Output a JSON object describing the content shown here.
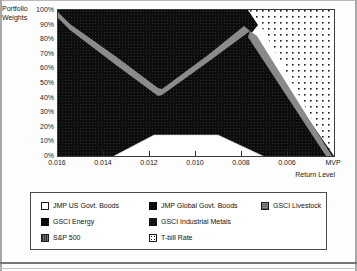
{
  "chart_data": {
    "type": "area",
    "title": "",
    "subtitle": "",
    "ylabel": "Portfolio Weights",
    "xlabel": "Return Level",
    "x_tick_labels": [
      "0.016",
      "0.014",
      "0.012",
      "0.010",
      "0.008",
      "0.006",
      "MVP"
    ],
    "y_tick_labels": [
      "100%",
      "90%",
      "80%",
      "70%",
      "60%",
      "50%",
      "40%",
      "30%",
      "20%",
      "10%",
      "0%"
    ],
    "ylim": [
      0,
      100
    ],
    "xlim_note": "Return level decreases left to right from 0.016 to MVP (minimum variance portfolio)",
    "grid": false,
    "stacked": true,
    "legend_position": "bottom",
    "legend_entries": [
      "JMP US Govt. Boods",
      "JMP Global Govt. Boods",
      "GSCI Livestock",
      "GSCI Energy",
      "GSCI Industrial Metals",
      "S&P 500",
      "T-bill Rate"
    ],
    "categories": [
      "0.016",
      "0.015",
      "0.014",
      "0.013",
      "0.012",
      "0.011",
      "0.010",
      "0.009",
      "0.008",
      "0.007",
      "0.006",
      "MVP"
    ],
    "series": [
      {
        "name": "JMP US Govt. Boods",
        "fill": "#ffffff",
        "pattern": "solid-white",
        "values": [
          0,
          0,
          0,
          7,
          14,
          14,
          14,
          8,
          0,
          0,
          0,
          0
        ]
      },
      {
        "name": "JMP Global Govt. Boods",
        "fill": "#0b0b0b",
        "pattern": "solid-black",
        "values": [
          0,
          0,
          0,
          0,
          0,
          0,
          0,
          0,
          0,
          0,
          0,
          0
        ]
      },
      {
        "name": "GSCI Livestock",
        "fill": "#8d8d8d",
        "pattern": "gray",
        "values": [
          0,
          0,
          0,
          0,
          2,
          2,
          2,
          2,
          2,
          2,
          2,
          0
        ]
      },
      {
        "name": "GSCI Energy",
        "fill": "#141414",
        "pattern": "solid-black",
        "values": [
          100,
          92,
          84,
          72,
          55,
          64,
          73,
          80,
          84,
          60,
          36,
          5
        ]
      },
      {
        "name": "GSCI Industrial Metals",
        "fill": "#1a1a1a",
        "pattern": "solid-black",
        "values": [
          0,
          8,
          16,
          21,
          29,
          20,
          11,
          10,
          14,
          10,
          6,
          0
        ]
      },
      {
        "name": "S&P 500",
        "fill": "#6e6e6e",
        "pattern": "hatch",
        "values": [
          0,
          0,
          0,
          0,
          0,
          0,
          0,
          0,
          0,
          0,
          0,
          0
        ]
      },
      {
        "name": "T-bill Rate",
        "fill": "#ffffff",
        "pattern": "dotted",
        "values": [
          0,
          0,
          0,
          0,
          0,
          0,
          0,
          0,
          0,
          28,
          56,
          95
        ]
      }
    ],
    "boundary_notes": {
      "top_black_region_start_pct": 100,
      "valley_at_0.012_pct": 55,
      "peak_at_0.008_pct": 85,
      "white_plateau_pct": 14,
      "tbill_onset_x": "0.0082"
    }
  },
  "legend": {
    "rows": [
      [
        {
          "label": "JMP US Govt. Boods",
          "swatch": "sw-white",
          "icon": "legend-swatch-white"
        },
        {
          "label": "JMP Global Govt. Boods",
          "swatch": "sw-black",
          "icon": "legend-swatch-black"
        },
        {
          "label": "GSCI Livestock",
          "swatch": "sw-gray",
          "icon": "legend-swatch-gray"
        }
      ],
      [
        {
          "label": "GSCI Energy",
          "swatch": "sw-black",
          "icon": "legend-swatch-black"
        },
        {
          "label": "GSCI Industrial Metals",
          "swatch": "sw-dark",
          "icon": "legend-swatch-dark"
        }
      ],
      [
        {
          "label": "S&P 500",
          "swatch": "sw-hatch",
          "icon": "legend-swatch-hatch"
        },
        {
          "label": "T-bill Rate",
          "swatch": "sw-dot",
          "icon": "legend-swatch-dotted"
        }
      ]
    ]
  },
  "axes": {
    "y_caption_line1": "Portfolio",
    "y_caption_line2": "Weights",
    "x_caption": "Return Level"
  },
  "colors": {
    "frame": "#3a3a3a",
    "text": "#1a1a1a",
    "black_area": "#0d0d0d",
    "gray_band": "#8d8d8d",
    "white_area": "#ffffff",
    "page": "#fdfdfd"
  }
}
